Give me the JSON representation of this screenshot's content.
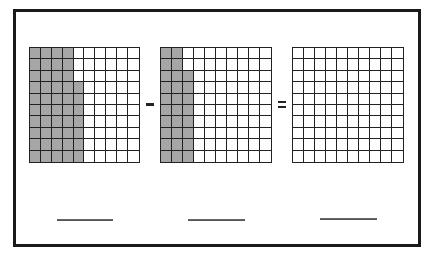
{
  "worksheet": {
    "type": "hundred-grid subtraction",
    "operator_1": "minus",
    "operator_2": "equals",
    "grids": [
      {
        "name": "minuend",
        "rows": 10,
        "cols": 10,
        "shaded_per_row": [
          4,
          4,
          4,
          5,
          5,
          5,
          5,
          5,
          5,
          5
        ],
        "shaded_total": 47
      },
      {
        "name": "subtrahend",
        "rows": 10,
        "cols": 10,
        "shaded_per_row": [
          2,
          2,
          3,
          3,
          3,
          3,
          3,
          3,
          3,
          3
        ],
        "shaded_total": 28
      },
      {
        "name": "difference",
        "rows": 10,
        "cols": 10,
        "shaded_per_row": [
          0,
          0,
          0,
          0,
          0,
          0,
          0,
          0,
          0,
          0
        ],
        "shaded_total": 0
      }
    ],
    "answer_blanks": [
      "",
      "",
      ""
    ],
    "colors": {
      "shaded": "#a6a6a6",
      "grid_line": "#222222",
      "border": "#1a1a1a"
    }
  }
}
